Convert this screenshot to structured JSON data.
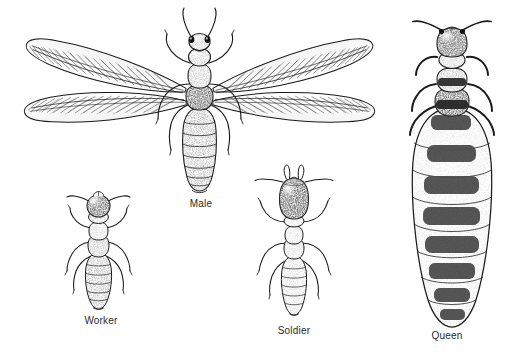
{
  "plate": {
    "kind": "scientific-illustration",
    "subject": "Termite castes",
    "style": "pen-and-ink stipple line drawing, black on white",
    "background_color": "#ffffff",
    "ink_color": "#1a1a1a",
    "label_color": "#2b2b2b"
  },
  "figures": [
    {
      "id": "male",
      "label": "Male",
      "caption_position": "below-center",
      "description": "Winged alate termite shown dorsally with four long membranous wings spread, long antennae, compound eyes and a segmented stippled abdomen",
      "wing_count": 4,
      "leg_count": 6,
      "antenna_count": 2,
      "abdomen_segments": 9
    },
    {
      "id": "worker",
      "label": "Worker",
      "caption_position": "below-center",
      "description": "Wingless pale worker termite with rounded stippled head, short beaded antennae and a banded segmented abdomen",
      "wing_count": 0,
      "leg_count": 6,
      "antenna_count": 2,
      "abdomen_segments": 8
    },
    {
      "id": "soldier",
      "label": "Soldier",
      "caption_position": "below-center",
      "description": "Wingless soldier termite with a greatly enlarged elongate head bearing a pair of long curved mandibles",
      "wing_count": 0,
      "leg_count": 6,
      "antenna_count": 2,
      "abdomen_segments": 8,
      "mandible_count": 2
    },
    {
      "id": "queen",
      "label": "Queen",
      "caption_position": "below-center",
      "description": "Physogastric queen with small head and thorax and a hugely distended egg-filled abdomen marked by dark transverse tergite bands",
      "wing_count": 0,
      "leg_count": 6,
      "antenna_count": 2,
      "abdomen_segments": 9,
      "tergite_bands": 8
    }
  ],
  "labels": {
    "male": "Male",
    "worker": "Worker",
    "soldier": "Soldier",
    "queen": "Queen"
  }
}
